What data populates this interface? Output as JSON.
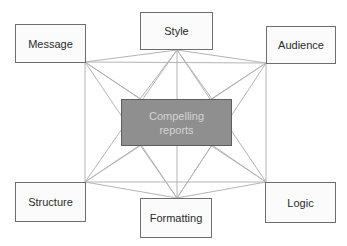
{
  "diagram": {
    "center": {
      "line1": "Compelling",
      "line2": "reports",
      "fill": "#8f8f8f",
      "text_color": "#d4d4d4"
    },
    "nodes": [
      {
        "id": "message",
        "label": "Message",
        "x": 15,
        "y": 24,
        "w": 71,
        "h": 39
      },
      {
        "id": "style",
        "label": "Style",
        "x": 140,
        "y": 12,
        "w": 73,
        "h": 38
      },
      {
        "id": "audience",
        "label": "Audience",
        "x": 266,
        "y": 26,
        "w": 70,
        "h": 38
      },
      {
        "id": "structure",
        "label": "Structure",
        "x": 15,
        "y": 182,
        "w": 71,
        "h": 40
      },
      {
        "id": "formatting",
        "label": "Formatting",
        "x": 140,
        "y": 198,
        "w": 72,
        "h": 40
      },
      {
        "id": "logic",
        "label": "Logic",
        "x": 265,
        "y": 182,
        "w": 71,
        "h": 41
      }
    ],
    "line_color": "#b4b4b4"
  }
}
